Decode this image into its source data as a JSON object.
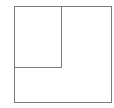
{
  "diagram": {
    "type": "nested-rectangles",
    "outer_box": {
      "x": 14,
      "y": 6,
      "width": 97,
      "height": 96
    },
    "inner_box": {
      "x": 14,
      "y": 6,
      "width": 48,
      "height": 62
    },
    "stroke_color": "#7a7a7a",
    "background_color": "#ffffff"
  }
}
